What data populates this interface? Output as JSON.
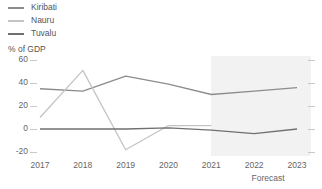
{
  "chart_data": {
    "type": "line",
    "title": "",
    "xlabel": "",
    "ylabel": "% of GDP",
    "categories": [
      "2017",
      "2018",
      "2019",
      "2020",
      "2021",
      "2022",
      "2023"
    ],
    "ylim": [
      -20,
      60
    ],
    "yticks": [
      60,
      40,
      20,
      0,
      -20
    ],
    "grid": false,
    "legend_position": "top-left",
    "forecast_label": "Forecast",
    "forecast_start_category": "2021",
    "forecast_end_category": "2023",
    "series": [
      {
        "name": "Kiribati",
        "color": "#8c8c8c",
        "values": [
          35,
          33,
          46,
          39,
          30,
          33,
          36
        ]
      },
      {
        "name": "Nauru",
        "color": "#c4c4c4",
        "values": [
          10,
          51,
          -18,
          3,
          3,
          null,
          null
        ]
      },
      {
        "name": "Tuvalu",
        "color": "#707070",
        "values": [
          0,
          0,
          0,
          1,
          -1,
          -4,
          0
        ]
      }
    ]
  },
  "legend": {
    "items": [
      {
        "label": "Kiribati",
        "color": "#8c8c8c"
      },
      {
        "label": "Nauru",
        "color": "#c4c4c4"
      },
      {
        "label": "Tuvalu",
        "color": "#707070"
      }
    ]
  },
  "axis": {
    "y_title": "% of GDP",
    "y_labels": [
      "60",
      "40",
      "20",
      "0",
      "-20"
    ],
    "x_labels": [
      "2017",
      "2018",
      "2019",
      "2020",
      "2021",
      "2022",
      "2023"
    ],
    "forecast_caption": "Forecast"
  }
}
